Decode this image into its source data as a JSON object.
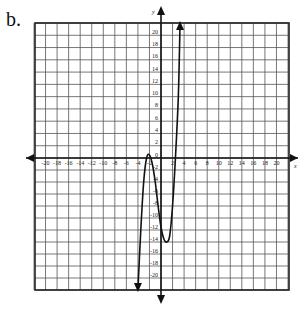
{
  "problem_label": "b.",
  "chart_data": {
    "type": "line",
    "title": "",
    "xlabel": "x",
    "ylabel": "y",
    "xlim": [
      -22,
      22
    ],
    "ylim": [
      -22,
      22
    ],
    "grid": true,
    "grid_step": 2,
    "x_ticks": [
      -20,
      -18,
      -16,
      -14,
      -12,
      -10,
      -8,
      -6,
      -4,
      -2,
      2,
      4,
      6,
      8,
      10,
      12,
      14,
      16,
      18,
      20
    ],
    "y_ticks": [
      20,
      18,
      16,
      14,
      12,
      10,
      8,
      6,
      4,
      2,
      0,
      -2,
      -4,
      -6,
      -8,
      -10,
      -12,
      -14,
      -16,
      -18,
      -20
    ],
    "series": [
      {
        "name": "cubic polynomial",
        "description": "Cubic with local max near (-2, 0.5) and local min near (1, -14); arrows at both ends",
        "points": [
          [
            -4,
            -22
          ],
          [
            -3.5,
            -12
          ],
          [
            -3,
            -4
          ],
          [
            -2.5,
            0
          ],
          [
            -2,
            0.5
          ],
          [
            -1.5,
            -1
          ],
          [
            -1,
            -4
          ],
          [
            -0.5,
            -8
          ],
          [
            0,
            -11.5
          ],
          [
            0.5,
            -13.5
          ],
          [
            1,
            -14
          ],
          [
            1.5,
            -13
          ],
          [
            2,
            -8
          ],
          [
            2.5,
            0
          ],
          [
            3,
            10
          ],
          [
            3.3,
            22
          ]
        ],
        "end_arrows": true
      }
    ]
  }
}
